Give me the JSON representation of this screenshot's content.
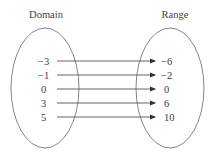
{
  "diagram": {
    "type": "mapping-diagram",
    "domain_title": "Domain",
    "range_title": "Range",
    "domain": [
      "−3",
      "−1",
      "0",
      "3",
      "5"
    ],
    "range": [
      "−6",
      "−2",
      "0",
      "6",
      "10"
    ],
    "mappings": [
      {
        "from": "−3",
        "to": "−6"
      },
      {
        "from": "−1",
        "to": "−2"
      },
      {
        "from": "0",
        "to": "0"
      },
      {
        "from": "3",
        "to": "6"
      },
      {
        "from": "5",
        "to": "10"
      }
    ],
    "colors": {
      "stroke": "#555555",
      "text": "#3a3a3a",
      "background": "#ffffff"
    }
  }
}
